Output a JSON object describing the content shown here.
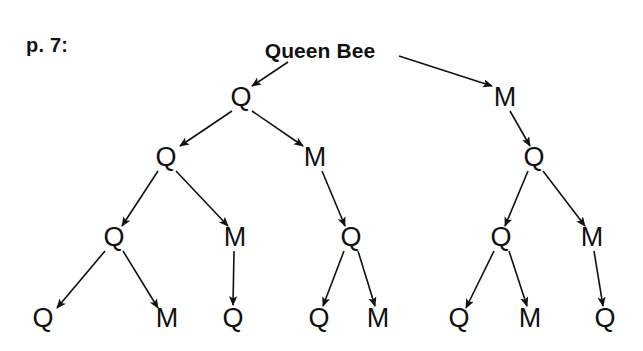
{
  "page": {
    "label": "p. 7:",
    "label_x": 26,
    "label_y": 34,
    "width": 643,
    "height": 351,
    "background": "#ffffff",
    "ink": "#111111"
  },
  "diagram": {
    "node_types": {
      "Q": "queen",
      "M": "male-drone"
    },
    "nodes": [
      {
        "id": "n0",
        "label": "Queen Bee",
        "x": 320,
        "y": 50,
        "level": 0,
        "root": true
      },
      {
        "id": "n1",
        "label": "Q",
        "x": 241,
        "y": 97,
        "level": 1
      },
      {
        "id": "n2",
        "label": "M",
        "x": 505,
        "y": 97,
        "level": 1
      },
      {
        "id": "n3",
        "label": "Q",
        "x": 166,
        "y": 157,
        "level": 2
      },
      {
        "id": "n4",
        "label": "M",
        "x": 315,
        "y": 157,
        "level": 2
      },
      {
        "id": "n5",
        "label": "Q",
        "x": 534,
        "y": 157,
        "level": 2
      },
      {
        "id": "n6",
        "label": "Q",
        "x": 114,
        "y": 237,
        "level": 3
      },
      {
        "id": "n7",
        "label": "M",
        "x": 235,
        "y": 237,
        "level": 3
      },
      {
        "id": "n8",
        "label": "Q",
        "x": 351,
        "y": 237,
        "level": 3
      },
      {
        "id": "n9",
        "label": "Q",
        "x": 501,
        "y": 237,
        "level": 3
      },
      {
        "id": "n10",
        "label": "M",
        "x": 592,
        "y": 237,
        "level": 3
      },
      {
        "id": "n11",
        "label": "Q",
        "x": 43,
        "y": 318,
        "level": 4
      },
      {
        "id": "n12",
        "label": "M",
        "x": 167,
        "y": 318,
        "level": 4
      },
      {
        "id": "n13",
        "label": "Q",
        "x": 233,
        "y": 318,
        "level": 4
      },
      {
        "id": "n14",
        "label": "Q",
        "x": 319,
        "y": 318,
        "level": 4
      },
      {
        "id": "n15",
        "label": "M",
        "x": 378,
        "y": 318,
        "level": 4
      },
      {
        "id": "n16",
        "label": "Q",
        "x": 459,
        "y": 318,
        "level": 4
      },
      {
        "id": "n17",
        "label": "M",
        "x": 530,
        "y": 318,
        "level": 4
      },
      {
        "id": "n18",
        "label": "Q",
        "x": 605,
        "y": 318,
        "level": 4
      }
    ],
    "edges": [
      {
        "from": "n0",
        "to": "n1",
        "x1": 288,
        "y1": 62,
        "x2": 252,
        "y2": 86
      },
      {
        "from": "n0",
        "to": "n2",
        "x1": 399,
        "y1": 56,
        "x2": 492,
        "y2": 86
      },
      {
        "from": "n1",
        "to": "n3",
        "x1": 232,
        "y1": 111,
        "x2": 180,
        "y2": 146
      },
      {
        "from": "n1",
        "to": "n4",
        "x1": 252,
        "y1": 111,
        "x2": 303,
        "y2": 146
      },
      {
        "from": "n2",
        "to": "n5",
        "x1": 510,
        "y1": 111,
        "x2": 530,
        "y2": 146
      },
      {
        "from": "n3",
        "to": "n6",
        "x1": 158,
        "y1": 171,
        "x2": 122,
        "y2": 226
      },
      {
        "from": "n3",
        "to": "n7",
        "x1": 176,
        "y1": 171,
        "x2": 228,
        "y2": 226
      },
      {
        "from": "n4",
        "to": "n8",
        "x1": 322,
        "y1": 171,
        "x2": 345,
        "y2": 226
      },
      {
        "from": "n5",
        "to": "n9",
        "x1": 528,
        "y1": 171,
        "x2": 505,
        "y2": 226
      },
      {
        "from": "n5",
        "to": "n10",
        "x1": 543,
        "y1": 171,
        "x2": 585,
        "y2": 226
      },
      {
        "from": "n6",
        "to": "n11",
        "x1": 105,
        "y1": 251,
        "x2": 57,
        "y2": 308
      },
      {
        "from": "n6",
        "to": "n12",
        "x1": 123,
        "y1": 251,
        "x2": 158,
        "y2": 308
      },
      {
        "from": "n7",
        "to": "n13",
        "x1": 234,
        "y1": 251,
        "x2": 233,
        "y2": 305
      },
      {
        "from": "n8",
        "to": "n14",
        "x1": 344,
        "y1": 251,
        "x2": 323,
        "y2": 306
      },
      {
        "from": "n8",
        "to": "n15",
        "x1": 358,
        "y1": 251,
        "x2": 375,
        "y2": 306
      },
      {
        "from": "n9",
        "to": "n16",
        "x1": 494,
        "y1": 251,
        "x2": 466,
        "y2": 308
      },
      {
        "from": "n9",
        "to": "n17",
        "x1": 509,
        "y1": 251,
        "x2": 527,
        "y2": 306
      },
      {
        "from": "n10",
        "to": "n18",
        "x1": 594,
        "y1": 251,
        "x2": 603,
        "y2": 306
      }
    ]
  }
}
